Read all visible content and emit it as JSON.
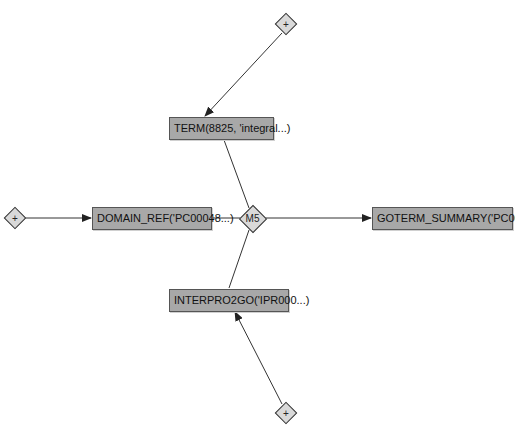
{
  "diagram": {
    "type": "flow-graph",
    "colors": {
      "box_fill": "#a8a8a8",
      "box_border": "#555555",
      "diamond_fill": "#d9d9d9",
      "edge": "#333333",
      "background": "#ffffff"
    },
    "center": {
      "id": "m5",
      "label": "M5"
    },
    "nodes": [
      {
        "id": "plus-top",
        "kind": "diamond",
        "label": "+"
      },
      {
        "id": "term",
        "kind": "box",
        "label": "TERM(8825, 'integral...)"
      },
      {
        "id": "plus-left",
        "kind": "diamond",
        "label": "+"
      },
      {
        "id": "domain-ref",
        "kind": "box",
        "label": "DOMAIN_REF('PC00048...)"
      },
      {
        "id": "goterm-summary",
        "kind": "box",
        "label": "GOTERM_SUMMARY('PC00...)"
      },
      {
        "id": "interpro2go",
        "kind": "box",
        "label": "INTERPRO2GO('IPR000...)"
      },
      {
        "id": "plus-bottom",
        "kind": "diamond",
        "label": "+"
      }
    ],
    "edges": [
      {
        "from": "plus-top",
        "to": "term",
        "arrow": true
      },
      {
        "from": "term",
        "to": "m5",
        "arrow": false
      },
      {
        "from": "plus-left",
        "to": "domain-ref",
        "arrow": true
      },
      {
        "from": "domain-ref",
        "to": "m5",
        "arrow": false
      },
      {
        "from": "m5",
        "to": "goterm-summary",
        "arrow": true
      },
      {
        "from": "interpro2go",
        "to": "m5",
        "arrow": false
      },
      {
        "from": "plus-bottom",
        "to": "interpro2go",
        "arrow": true
      }
    ]
  }
}
